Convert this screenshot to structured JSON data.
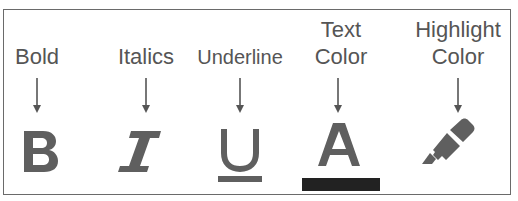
{
  "diagram": {
    "colors": {
      "text": "#555555",
      "icon": "#5f5f5f",
      "arrow": "#555555",
      "border": "#6a6a6a",
      "text_color_bar": "#222222"
    },
    "items": [
      {
        "label_lines": [
          "Bold"
        ],
        "icon": "bold-icon",
        "glyph": "B"
      },
      {
        "label_lines": [
          "Italics"
        ],
        "icon": "italic-icon",
        "glyph": "I"
      },
      {
        "label_lines": [
          "Underline"
        ],
        "icon": "underline-icon",
        "glyph": "U"
      },
      {
        "label_lines": [
          "Text",
          "Color"
        ],
        "icon": "text-color-icon",
        "glyph": "A"
      },
      {
        "label_lines": [
          "Highlight",
          "Color"
        ],
        "icon": "highlight-color-icon",
        "glyph": ""
      }
    ]
  }
}
